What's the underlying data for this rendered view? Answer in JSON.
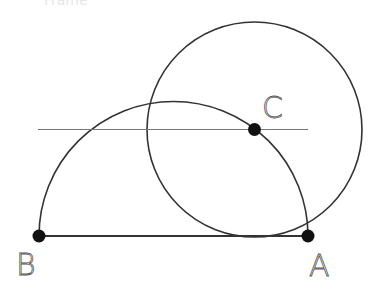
{
  "diagram": {
    "top_partial_text": "Frame",
    "points": [
      {
        "id": "A",
        "label": "A"
      },
      {
        "id": "B",
        "label": "B"
      },
      {
        "id": "C",
        "label": "C"
      }
    ],
    "elements": [
      {
        "type": "segment",
        "from": "B",
        "to": "A"
      },
      {
        "type": "semicircle",
        "diameter": [
          "B",
          "A"
        ]
      },
      {
        "type": "circle",
        "center": "C",
        "through": "A"
      },
      {
        "type": "line",
        "through": "C",
        "orientation": "parallel to BA"
      }
    ],
    "colors": {
      "stroke": "#333333",
      "line": "#777777",
      "point": "#111111",
      "label": "#555555"
    }
  }
}
